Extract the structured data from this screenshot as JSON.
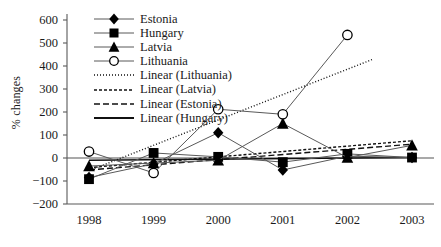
{
  "chart_data": {
    "type": "line",
    "title": "",
    "xlabel": "",
    "ylabel": "% changes",
    "categories": [
      "1998",
      "1999",
      "2000",
      "2001",
      "2002",
      "2003"
    ],
    "x": [
      1998,
      1999,
      2000,
      2001,
      2002,
      2003
    ],
    "ylim": [
      -200,
      600
    ],
    "yticks": [
      -200,
      -100,
      0,
      100,
      200,
      300,
      400,
      500,
      600
    ],
    "ytick_labels": [
      "−200",
      "−100",
      "0",
      "100",
      "200",
      "300",
      "400",
      "500",
      "600"
    ],
    "grid": false,
    "zero_line": true,
    "legend_position": "top-left",
    "series": [
      {
        "name": "Estonia",
        "marker": "filled-diamond",
        "line_style": "solid",
        "values": [
          -85,
          -25,
          110,
          -52,
          8,
          2
        ]
      },
      {
        "name": "Hungary",
        "marker": "filled-square",
        "line_style": "solid",
        "values": [
          -92,
          22,
          5,
          -18,
          18,
          2
        ]
      },
      {
        "name": "Latvia",
        "marker": "filled-triangle",
        "line_style": "solid",
        "values": [
          -35,
          -22,
          -10,
          150,
          2,
          55
        ]
      },
      {
        "name": "Lithuania",
        "marker": "open-circle",
        "line_style": "solid",
        "values": [
          28,
          -65,
          212,
          190,
          535,
          null
        ]
      }
    ],
    "trendlines": [
      {
        "name": "Linear (Lithuania)",
        "line_style": "dotted",
        "x_start": 1998,
        "x_end": 2002.4,
        "y_start": -55,
        "y_end": 430
      },
      {
        "name": "Linear (Latvia)",
        "line_style": "dashed",
        "x_start": 1998,
        "x_end": 2003,
        "y_start": -42,
        "y_end": 75
      },
      {
        "name": "Linear (Estonia)",
        "line_style": "long-dash",
        "x_start": 1998,
        "x_end": 2003,
        "y_start": -52,
        "y_end": 60
      },
      {
        "name": "Linear (Hungary)",
        "line_style": "solid",
        "x_start": 1998,
        "x_end": 2003,
        "y_start": -10,
        "y_end": 2
      }
    ],
    "legend": [
      {
        "label": "Estonia",
        "key": "filled-diamond"
      },
      {
        "label": "Hungary",
        "key": "filled-square"
      },
      {
        "label": "Latvia",
        "key": "filled-triangle"
      },
      {
        "label": "Lithuania",
        "key": "open-circle"
      },
      {
        "label": "Linear (Lithuania)",
        "key": "dotted-line"
      },
      {
        "label": "Linear (Latvia)",
        "key": "dashed-line"
      },
      {
        "label": "Linear (Estonia)",
        "key": "long-dash-line"
      },
      {
        "label": "Linear (Hungary)",
        "key": "solid-line"
      }
    ],
    "colors": {
      "series_line": "#595959",
      "marker_fill": "#000000",
      "axis": "#595959",
      "zero_line": "#8c8c8c",
      "text": "#1a1a1a",
      "background": "#ffffff"
    }
  }
}
